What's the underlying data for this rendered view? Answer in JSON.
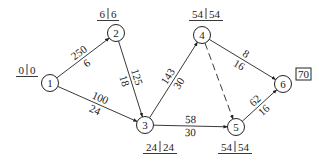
{
  "diagram": {
    "type": "network-schedule",
    "nodes": [
      {
        "id": "1",
        "x": 50,
        "y": 83,
        "times": [
          "0",
          "0"
        ],
        "tpos": [
          16,
          74
        ]
      },
      {
        "id": "2",
        "x": 116,
        "y": 33,
        "times": [
          "6",
          "6"
        ],
        "tpos": [
          97,
          18
        ]
      },
      {
        "id": "3",
        "x": 145,
        "y": 125,
        "times": [
          "24",
          "24"
        ],
        "tpos": [
          143,
          151
        ]
      },
      {
        "id": "4",
        "x": 202,
        "y": 35,
        "times": [
          "54",
          "54"
        ],
        "tpos": [
          189,
          18
        ]
      },
      {
        "id": "5",
        "x": 236,
        "y": 127,
        "times": [
          "54",
          "54"
        ],
        "tpos": [
          218,
          151
        ]
      },
      {
        "id": "6",
        "x": 283,
        "y": 84,
        "times": null
      }
    ],
    "edges": [
      {
        "from": "1",
        "to": "2",
        "top": "250",
        "bottom": "6",
        "dashed": false
      },
      {
        "from": "1",
        "to": "3",
        "top": "100",
        "bottom": "24",
        "dashed": false
      },
      {
        "from": "2",
        "to": "3",
        "top": "125",
        "bottom": "18",
        "dashed": false
      },
      {
        "from": "3",
        "to": "4",
        "top": "143",
        "bottom": "30",
        "dashed": false
      },
      {
        "from": "3",
        "to": "5",
        "top": "58",
        "bottom": "30",
        "dashed": false
      },
      {
        "from": "4",
        "to": "5",
        "top": "",
        "bottom": "",
        "dashed": true
      },
      {
        "from": "4",
        "to": "6",
        "top": "8",
        "bottom": "16",
        "dashed": false
      },
      {
        "from": "5",
        "to": "6",
        "top": "62",
        "bottom": "16",
        "dashed": false
      }
    ],
    "total_duration": "70"
  }
}
